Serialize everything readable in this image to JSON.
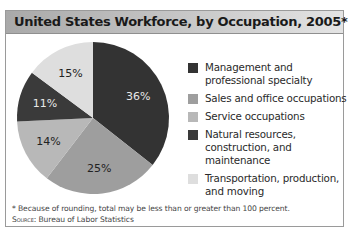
{
  "title": "United States Workforce, by Occupation, 2005*",
  "chart_data": {
    "type": "pie",
    "title": "United States Workforce, by Occupation, 2005*",
    "categories": [
      "Management and professional specialty",
      "Sales and office occupations",
      "Service occupations",
      "Natural resources, construction, and maintenance",
      "Transportation, production, and moving"
    ],
    "values": [
      36,
      25,
      14,
      11,
      15
    ],
    "labels": [
      "36%",
      "25%",
      "14%",
      "11%",
      "15%"
    ],
    "colors": [
      "#333333",
      "#9e9e9e",
      "#b8b8b8",
      "#3a3a3a",
      "#dedede"
    ],
    "legend_position": "right",
    "start_angle_deg": 0,
    "direction": "clockwise"
  },
  "legend": {
    "items": [
      {
        "label": "Management and professional specialty",
        "color": "#333333"
      },
      {
        "label": "Sales and office occupations",
        "color": "#9e9e9e"
      },
      {
        "label": "Service occupations",
        "color": "#b8b8b8"
      },
      {
        "label": "Natural resources, construction, and maintenance",
        "color": "#3a3a3a"
      },
      {
        "label": "Transportation, production, and moving",
        "color": "#dedede"
      }
    ]
  },
  "footnote": {
    "note": "* Because of rounding, total may be less than or greater than 100 percent.",
    "source_prefix": "Source:",
    "source_text": " Bureau of Labor Statistics"
  }
}
